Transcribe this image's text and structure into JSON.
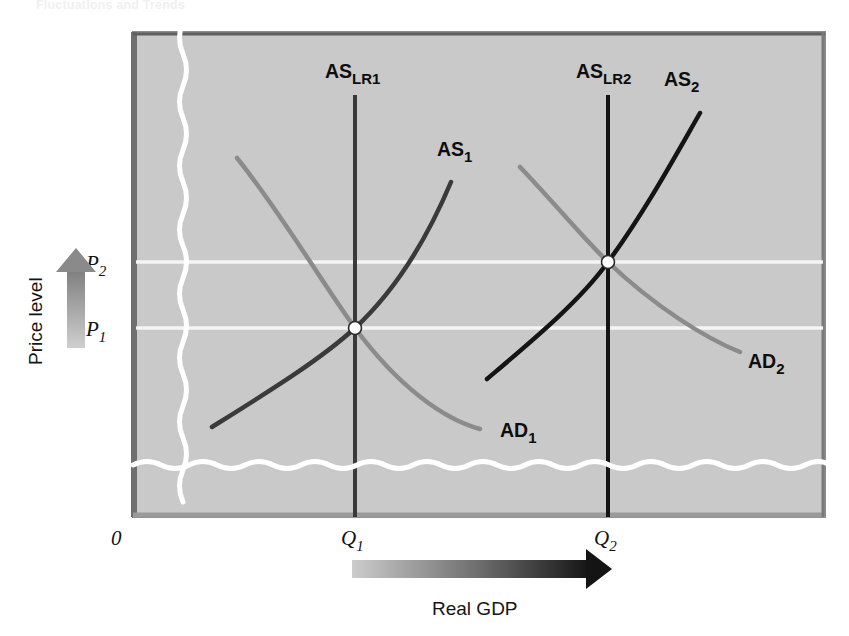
{
  "figure": {
    "caption": "Fluctuations and Trends",
    "background_color": "#c9c9c9",
    "border_color": "#6f6f6f"
  },
  "axes": {
    "origin_label": "0",
    "y_axis_title": "Price level",
    "x_axis_title": "Real GDP",
    "y_ticks": [
      {
        "id": "p2",
        "label": "P",
        "sub": "2",
        "y": 262
      },
      {
        "id": "p1",
        "label": "P",
        "sub": "1",
        "y": 328
      }
    ],
    "x_ticks": [
      {
        "id": "q1",
        "label": "Q",
        "sub": "1",
        "x": 355
      },
      {
        "id": "q2",
        "label": "Q",
        "sub": "2",
        "x": 608
      }
    ]
  },
  "curves": [
    {
      "id": "as-lr1",
      "name": "AS_LR1",
      "label": "AS",
      "sublabel": "LR1",
      "kind": "vertical-long-run-supply",
      "color": "#3a3a3a",
      "width": 4,
      "label_x": 325,
      "label_y": 78,
      "path": "M 355 95 L 355 517"
    },
    {
      "id": "as-lr2",
      "name": "AS_LR2",
      "label": "AS",
      "sublabel": "LR2",
      "kind": "vertical-long-run-supply",
      "color": "#141414",
      "width": 4,
      "label_x": 576,
      "label_y": 78,
      "path": "M 608 95 L 608 517"
    },
    {
      "id": "as1",
      "name": "AS_1",
      "label": "AS",
      "sublabel": "1",
      "kind": "short-run-aggregate-supply",
      "color": "#3a3a3a",
      "width": 4.5,
      "label_x": 437,
      "label_y": 156,
      "path": "M 212 427 C 268 392 320 360 355 328 C 397 289 427 239 451 182"
    },
    {
      "id": "as2",
      "name": "AS_2",
      "label": "AS",
      "sublabel": "2",
      "kind": "short-run-aggregate-supply",
      "color": "#141414",
      "width": 4.5,
      "label_x": 664,
      "label_y": 86,
      "path": "M 487 379 C 533 340 580 301 608 262 C 644 213 673 160 700 113"
    },
    {
      "id": "ad1",
      "name": "AD_1",
      "label": "AD",
      "sublabel": "1",
      "kind": "aggregate-demand",
      "color": "#8b8b8b",
      "width": 4.5,
      "label_x": 500,
      "label_y": 437,
      "path": "M 237 158 C 282 214 322 283 355 328 C 398 386 443 419 480 429"
    },
    {
      "id": "ad2",
      "name": "AD_2",
      "label": "AD",
      "sublabel": "2",
      "kind": "aggregate-demand",
      "color": "#8b8b8b",
      "width": 4.5,
      "label_x": 748,
      "label_y": 368,
      "path": "M 520 167 C 558 207 583 238 608 262 C 654 306 705 338 740 352"
    }
  ],
  "equilibria": [
    {
      "id": "eq1",
      "name": "equilibrium-1",
      "x": 355,
      "y": 328
    },
    {
      "id": "eq2",
      "name": "equilibrium-2",
      "x": 608,
      "y": 262
    }
  ],
  "breaks": {
    "vertical_x": 182,
    "horizontal_y": 465,
    "color": "#ffffff"
  },
  "gridlines": {
    "color": "#f4f4f4",
    "rows": [
      262,
      328
    ]
  },
  "arrows": {
    "price": {
      "name": "price-level-arrow",
      "direction": "up",
      "from": "#cfcfcf",
      "to": "#7d7d7d"
    },
    "gdp": {
      "name": "real-gdp-arrow",
      "direction": "right",
      "from": "#cfcfcf",
      "to": "#1b1b1b"
    }
  },
  "plot_box": {
    "x": 133,
    "y": 32,
    "w": 692,
    "h": 485
  }
}
